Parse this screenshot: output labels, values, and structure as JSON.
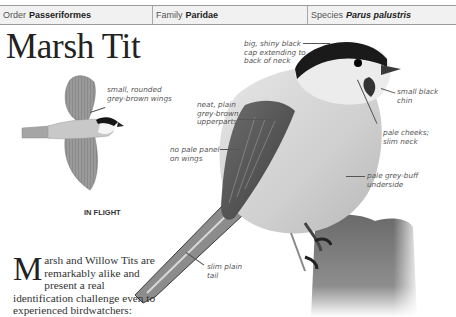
{
  "header": {
    "order_label": "Order",
    "order_value": "Passeriformes",
    "family_label": "Family",
    "family_value": "Paridae",
    "species_label": "Species",
    "species_value": "Parus palustris"
  },
  "title": "Marsh Tit",
  "flight": {
    "caption": "IN FLIGHT",
    "annotation": "small, rounded\ngrey-brown wings"
  },
  "annotations": {
    "cap": "big, shiny black\ncap extending to\nback of neck",
    "chin": "small black\nchin",
    "upperparts": "neat, plain\ngrey-brown\nupperparts",
    "cheeks": "pale cheeks;\nslim neck",
    "wing_panel": "no pale panel\non wings",
    "underside": "pale grey-buff\nunderside",
    "tail": "slim plain\ntail"
  },
  "intro": {
    "dropcap": "M",
    "text": "arsh and Willow Tits are remarkably alike and present a real identification challenge even to experienced birdwatchers:"
  },
  "colors": {
    "header_bg": "#f1f1f1",
    "header_border": "#9a9a9a",
    "text": "#222222",
    "annotation": "#555555"
  }
}
